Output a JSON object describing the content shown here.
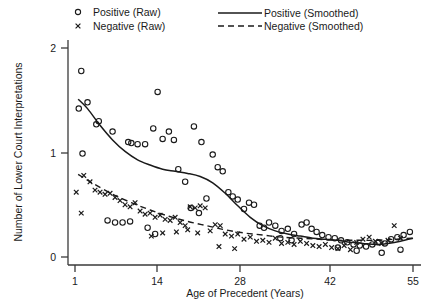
{
  "chart_data": {
    "type": "scatter",
    "title": "",
    "xlabel": "Age of Precedent (Years)",
    "ylabel": "Number of Lower Court Interpretations",
    "xlim": [
      1,
      55
    ],
    "ylim": [
      0,
      2.1
    ],
    "xticks": [
      1,
      14,
      28,
      42,
      55
    ],
    "xticklabels": [
      "1",
      "14",
      "28",
      "42",
      "55"
    ],
    "yticks": [
      0,
      1,
      2
    ],
    "yticklabels": [
      "0",
      "1",
      "2"
    ],
    "grid": false,
    "legend_position": "top",
    "legend": [
      {
        "key": "positive_raw",
        "label": "Positive (Raw)",
        "marker": "open-circle"
      },
      {
        "key": "negative_raw",
        "label": "Negative (Raw)",
        "marker": "x-cross"
      },
      {
        "key": "positive_smoothed",
        "label": "Positive (Smoothed)",
        "marker": "solid-line"
      },
      {
        "key": "negative_smoothed",
        "label": "Negative (Smoothed)",
        "marker": "dashed-line"
      }
    ],
    "series": [
      {
        "name": "Positive (Raw)",
        "marker": "open-circle",
        "points": [
          [
            2.0,
            1.78
          ],
          [
            1.6,
            1.42
          ],
          [
            3.0,
            1.48
          ],
          [
            4.4,
            1.27
          ],
          [
            4.8,
            1.3
          ],
          [
            2.2,
            0.99
          ],
          [
            7.0,
            1.2
          ],
          [
            9.5,
            1.1
          ],
          [
            10.0,
            1.09
          ],
          [
            11.0,
            1.08
          ],
          [
            12.2,
            1.08
          ],
          [
            13.5,
            1.23
          ],
          [
            15.0,
            1.13
          ],
          [
            16.0,
            1.2
          ],
          [
            16.8,
            1.12
          ],
          [
            14.2,
            1.58
          ],
          [
            17.5,
            0.84
          ],
          [
            18.6,
            0.72
          ],
          [
            20.0,
            1.25
          ],
          [
            21.2,
            1.1
          ],
          [
            22.0,
            0.56
          ],
          [
            23.0,
            0.98
          ],
          [
            23.8,
            0.86
          ],
          [
            24.6,
            0.82
          ],
          [
            25.5,
            0.62
          ],
          [
            26.2,
            0.58
          ],
          [
            27.0,
            0.55
          ],
          [
            28.0,
            0.46
          ],
          [
            28.8,
            0.52
          ],
          [
            29.6,
            0.5
          ],
          [
            30.5,
            0.3
          ],
          [
            31.2,
            0.28
          ],
          [
            32.0,
            0.33
          ],
          [
            33.0,
            0.3
          ],
          [
            34.0,
            0.25
          ],
          [
            35.0,
            0.27
          ],
          [
            36.0,
            0.22
          ],
          [
            37.2,
            0.31
          ],
          [
            38.0,
            0.33
          ],
          [
            38.8,
            0.27
          ],
          [
            39.6,
            0.24
          ],
          [
            40.5,
            0.21
          ],
          [
            41.5,
            0.19
          ],
          [
            42.5,
            0.18
          ],
          [
            43.5,
            0.16
          ],
          [
            44.5,
            0.14
          ],
          [
            45.5,
            0.12
          ],
          [
            46.5,
            0.11
          ],
          [
            47.5,
            0.1
          ],
          [
            48.5,
            0.12
          ],
          [
            49.5,
            0.14
          ],
          [
            50.5,
            0.13
          ],
          [
            51.5,
            0.17
          ],
          [
            52.5,
            0.19
          ],
          [
            53.5,
            0.21
          ],
          [
            54.5,
            0.24
          ],
          [
            6.2,
            0.35
          ],
          [
            7.4,
            0.33
          ],
          [
            8.6,
            0.33
          ],
          [
            9.8,
            0.34
          ],
          [
            12.6,
            0.28
          ],
          [
            13.8,
            0.22
          ],
          [
            19.5,
            0.47
          ],
          [
            20.8,
            0.42
          ],
          [
            33.8,
            0.18
          ],
          [
            35.6,
            0.16
          ],
          [
            43.0,
            0.09
          ],
          [
            46.0,
            0.06
          ],
          [
            50.0,
            0.04
          ],
          [
            53.0,
            0.07
          ]
        ]
      },
      {
        "name": "Negative (Raw)",
        "marker": "x-cross",
        "points": [
          [
            1.2,
            0.62
          ],
          [
            2.4,
            0.78
          ],
          [
            3.4,
            0.72
          ],
          [
            4.2,
            0.64
          ],
          [
            5.0,
            0.62
          ],
          [
            5.8,
            0.6
          ],
          [
            6.6,
            0.61
          ],
          [
            7.4,
            0.57
          ],
          [
            8.2,
            0.54
          ],
          [
            2.0,
            0.42
          ],
          [
            9.0,
            0.5
          ],
          [
            9.8,
            0.48
          ],
          [
            10.6,
            0.52
          ],
          [
            11.4,
            0.44
          ],
          [
            12.2,
            0.41
          ],
          [
            13.0,
            0.42
          ],
          [
            13.8,
            0.38
          ],
          [
            14.6,
            0.4
          ],
          [
            15.4,
            0.36
          ],
          [
            16.2,
            0.35
          ],
          [
            17.0,
            0.38
          ],
          [
            17.8,
            0.33
          ],
          [
            18.6,
            0.3
          ],
          [
            19.4,
            0.48
          ],
          [
            20.2,
            0.47
          ],
          [
            21.0,
            0.49
          ],
          [
            21.8,
            0.47
          ],
          [
            13.2,
            0.2
          ],
          [
            15.0,
            0.23
          ],
          [
            17.2,
            0.24
          ],
          [
            19.0,
            0.26
          ],
          [
            20.6,
            0.23
          ],
          [
            22.6,
            0.25
          ],
          [
            23.4,
            0.31
          ],
          [
            24.2,
            0.3
          ],
          [
            25.0,
            0.22
          ],
          [
            26.0,
            0.2
          ],
          [
            27.0,
            0.22
          ],
          [
            28.0,
            0.17
          ],
          [
            29.0,
            0.19
          ],
          [
            30.0,
            0.15
          ],
          [
            31.0,
            0.16
          ],
          [
            32.0,
            0.14
          ],
          [
            33.0,
            0.18
          ],
          [
            34.0,
            0.13
          ],
          [
            35.0,
            0.14
          ],
          [
            36.0,
            0.12
          ],
          [
            37.0,
            0.15
          ],
          [
            38.0,
            0.13
          ],
          [
            39.0,
            0.11
          ],
          [
            40.0,
            0.1
          ],
          [
            41.0,
            0.12
          ],
          [
            42.0,
            0.09
          ],
          [
            43.0,
            0.08
          ],
          [
            44.0,
            0.11
          ],
          [
            45.0,
            0.07
          ],
          [
            46.0,
            0.14
          ],
          [
            47.0,
            0.17
          ],
          [
            48.0,
            0.19
          ],
          [
            49.0,
            0.15
          ],
          [
            50.0,
            0.13
          ],
          [
            51.0,
            0.16
          ],
          [
            52.0,
            0.3
          ],
          [
            53.0,
            0.18
          ],
          [
            24.0,
            0.1
          ],
          [
            26.5,
            0.08
          ]
        ]
      }
    ],
    "smoothed": [
      {
        "name": "Positive (Smoothed)",
        "style": "solid",
        "points": [
          [
            1.5,
            1.51
          ],
          [
            3.0,
            1.42
          ],
          [
            5.0,
            1.26
          ],
          [
            7.0,
            1.12
          ],
          [
            9.0,
            1.01
          ],
          [
            11.0,
            0.93
          ],
          [
            13.0,
            0.88
          ],
          [
            15.0,
            0.84
          ],
          [
            17.0,
            0.82
          ],
          [
            19.0,
            0.8
          ],
          [
            21.0,
            0.77
          ],
          [
            23.0,
            0.71
          ],
          [
            25.0,
            0.61
          ],
          [
            27.0,
            0.49
          ],
          [
            29.0,
            0.38
          ],
          [
            31.0,
            0.3
          ],
          [
            33.0,
            0.25
          ],
          [
            35.0,
            0.22
          ],
          [
            37.0,
            0.2
          ],
          [
            39.0,
            0.18
          ],
          [
            41.0,
            0.17
          ],
          [
            43.0,
            0.16
          ],
          [
            45.0,
            0.14
          ],
          [
            47.0,
            0.13
          ],
          [
            49.0,
            0.12
          ],
          [
            51.0,
            0.13
          ],
          [
            53.0,
            0.15
          ],
          [
            55.0,
            0.18
          ]
        ]
      },
      {
        "name": "Negative (Smoothed)",
        "style": "dashed",
        "points": [
          [
            1.5,
            0.79
          ],
          [
            4.0,
            0.7
          ],
          [
            7.0,
            0.6
          ],
          [
            10.0,
            0.52
          ],
          [
            13.0,
            0.45
          ],
          [
            16.0,
            0.39
          ],
          [
            19.0,
            0.34
          ],
          [
            22.0,
            0.3
          ],
          [
            25.0,
            0.26
          ],
          [
            28.0,
            0.23
          ],
          [
            31.0,
            0.21
          ],
          [
            34.0,
            0.19
          ],
          [
            37.0,
            0.18
          ],
          [
            40.0,
            0.17
          ],
          [
            43.0,
            0.16
          ],
          [
            46.0,
            0.16
          ],
          [
            49.0,
            0.16
          ],
          [
            52.0,
            0.17
          ],
          [
            55.0,
            0.18
          ]
        ]
      }
    ]
  }
}
